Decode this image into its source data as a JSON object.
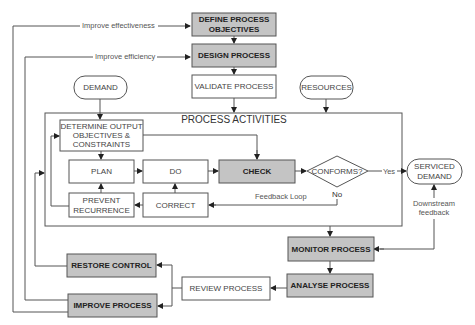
{
  "diagram": {
    "title": "PROCESS ACTIVITIES",
    "nodes": {
      "define_objectives": {
        "line1": "DEFINE PROCESS",
        "line2": "OBJECTIVES",
        "style": "shaded"
      },
      "design_process": {
        "label": "DESIGN PROCESS",
        "style": "shaded"
      },
      "validate_process": {
        "label": "VALIDATE PROCESS",
        "style": "plain"
      },
      "demand": {
        "label": "DEMAND",
        "shape": "rounded"
      },
      "resources": {
        "label": "RESOURCES",
        "shape": "rounded"
      },
      "determine_output": {
        "line1": "DETERMINE OUTPUT",
        "line2": "OBJECTIVES &",
        "line3": "CONSTRAINTS"
      },
      "plan": {
        "label": "PLAN"
      },
      "do": {
        "label": "DO"
      },
      "check": {
        "label": "CHECK",
        "style": "shaded"
      },
      "conforms": {
        "label": "CONFORMS?",
        "shape": "diamond"
      },
      "serviced_demand": {
        "line1": "SERVICED",
        "line2": "DEMAND",
        "shape": "rounded"
      },
      "prevent_recurrence": {
        "line1": "PREVENT",
        "line2": "RECURRENCE"
      },
      "correct": {
        "label": "CORRECT"
      },
      "monitor_process": {
        "label": "MONITOR PROCESS",
        "style": "shaded"
      },
      "analyse_process": {
        "label": "ANALYSE PROCESS",
        "style": "shaded"
      },
      "review_process": {
        "label": "REVIEW PROCESS"
      },
      "restore_control": {
        "label": "RESTORE CONTROL",
        "style": "shaded"
      },
      "improve_process": {
        "label": "IMPROVE PROCESS",
        "style": "shaded"
      }
    },
    "edge_labels": {
      "improve_effectiveness": "Improve effectiveness",
      "improve_efficiency": "Improve efficiency",
      "yes": "Yes",
      "no": "No",
      "feedback_loop": "Feedback Loop",
      "downstream_line1": "Downstream",
      "downstream_line2": "feedback"
    },
    "colors": {
      "shaded_fill": "#c4c4c4",
      "stroke": "#555555",
      "background": "#ffffff"
    }
  }
}
